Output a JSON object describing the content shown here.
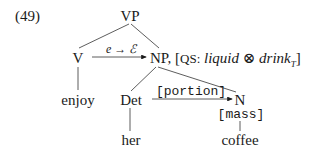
{
  "example_number": "(49)",
  "tree": {
    "root": "VP",
    "verb": {
      "category": "V",
      "word": "enjoy"
    },
    "np": {
      "category": "NP,",
      "qualia": {
        "open": "[",
        "label": "QS:",
        "value_a": "liquid",
        "operator": "⊗",
        "value_b": "drink",
        "value_b_subscript": "T",
        "close": "]"
      }
    },
    "det": {
      "category": "Det",
      "word": "her"
    },
    "noun": {
      "category": "N",
      "feature": "[mass]",
      "word": "coffee"
    }
  },
  "arrows": {
    "coercion": {
      "from": "V",
      "to": "NP",
      "label_left": "e",
      "label_arrow": "→",
      "label_right": "ℰ"
    },
    "portion": {
      "from": "Det",
      "to": "N",
      "label": "[portion]"
    }
  },
  "colors": {
    "ink": "#1a1a1a",
    "background": "#ffffff"
  }
}
